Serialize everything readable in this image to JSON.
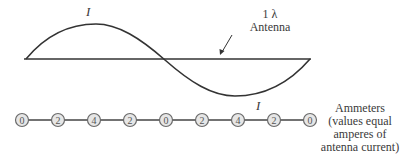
{
  "diagram": {
    "colors": {
      "line": "#333333",
      "meter_fill": "#e6e6e6",
      "meter_stroke": "#6a6a6a",
      "text": "#3a3a3a"
    },
    "current_label_top": "I",
    "current_label_bottom": "I",
    "antenna_label": {
      "line1": "1 λ",
      "line2": "Antenna"
    },
    "ammeters": {
      "values": [
        "0",
        "2",
        "4",
        "2",
        "0",
        "2",
        "4",
        "2",
        "0"
      ],
      "caption_lines": [
        "Ammeters",
        "(values equal",
        "amperes of",
        "antenna current)"
      ]
    }
  }
}
